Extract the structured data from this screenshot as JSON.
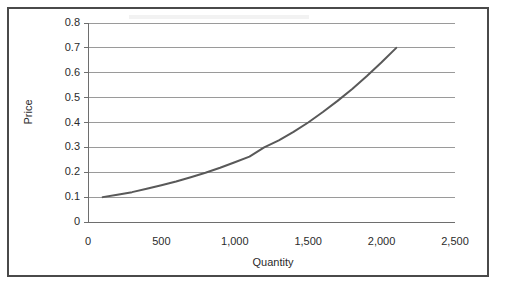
{
  "figure": {
    "frame_border_color": "#4a4a4a",
    "background_color": "#ffffff"
  },
  "chart_data": {
    "type": "line",
    "title": "",
    "subtitle": "",
    "xlabel": "Quantity",
    "ylabel": "Price",
    "xlim": [
      0,
      2500
    ],
    "ylim": [
      0,
      0.8
    ],
    "grid": "horizontal",
    "legend": "none",
    "series": [
      {
        "name": "Supply curve",
        "color": "#595959",
        "line_width": 2,
        "x": [
          100,
          200,
          300,
          400,
          500,
          600,
          700,
          800,
          900,
          1000,
          1100,
          1200,
          1300,
          1400,
          1500,
          1600,
          1700,
          1800,
          1900,
          2000,
          2100
        ],
        "y": [
          0.1,
          0.11,
          0.12,
          0.134,
          0.148,
          0.163,
          0.18,
          0.198,
          0.218,
          0.24,
          0.263,
          0.3,
          0.328,
          0.362,
          0.4,
          0.442,
          0.487,
          0.535,
          0.587,
          0.642,
          0.7
        ]
      }
    ],
    "x_ticks": [
      {
        "value": 0,
        "label": "0"
      },
      {
        "value": 500,
        "label": "500"
      },
      {
        "value": 1000,
        "label": "1,000"
      },
      {
        "value": 1500,
        "label": "1,500"
      },
      {
        "value": 2000,
        "label": "2,000"
      },
      {
        "value": 2500,
        "label": "2,500"
      }
    ],
    "y_ticks": [
      {
        "value": 0,
        "label": "0"
      },
      {
        "value": 0.1,
        "label": "0.1"
      },
      {
        "value": 0.2,
        "label": "0.2"
      },
      {
        "value": 0.3,
        "label": "0.3"
      },
      {
        "value": 0.4,
        "label": "0.4"
      },
      {
        "value": 0.5,
        "label": "0.5"
      },
      {
        "value": 0.6,
        "label": "0.6"
      },
      {
        "value": 0.7,
        "label": "0.7"
      },
      {
        "value": 0.8,
        "label": "0.8"
      }
    ],
    "gridline_color": "#9a9a9a",
    "axis_color": "#6e6e6e"
  }
}
